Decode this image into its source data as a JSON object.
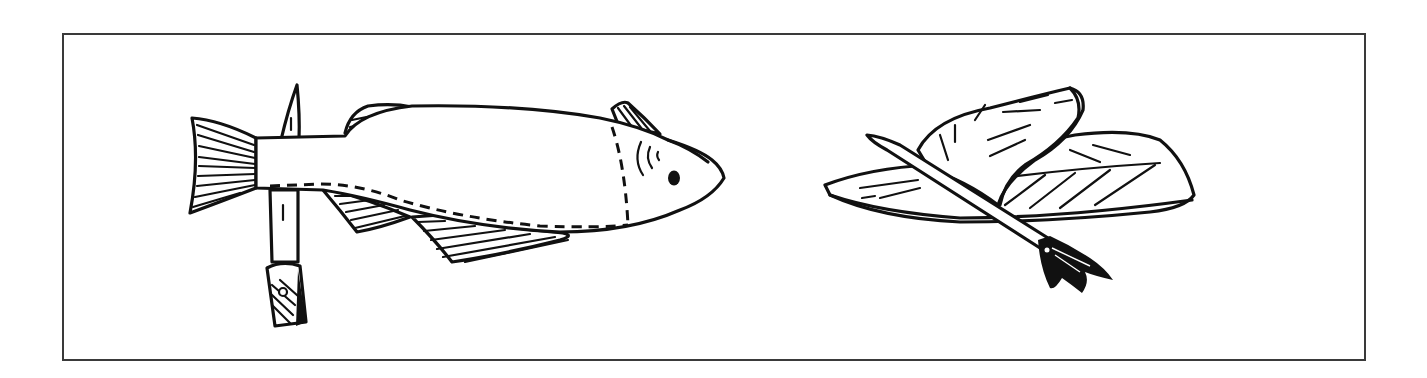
{
  "figure": {
    "panels": [
      {
        "id": "left",
        "subject": "whole fish skewered vertically through the tail section with a stick"
      },
      {
        "id": "right",
        "subject": "folded fish fillets skewered on a stick with a frayed end"
      }
    ],
    "colors": {
      "ink": "#111111",
      "frame": "#3a3a3a",
      "background": "#ffffff"
    }
  }
}
